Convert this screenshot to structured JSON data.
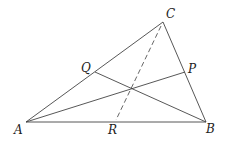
{
  "diagram": {
    "type": "triangle-cevians",
    "points": {
      "A": {
        "label": "A",
        "x": 26,
        "y": 122
      },
      "B": {
        "label": "B",
        "x": 206,
        "y": 122
      },
      "C": {
        "label": "C",
        "x": 163,
        "y": 22
      },
      "P": {
        "label": "P",
        "x": 185,
        "y": 72
      },
      "Q": {
        "label": "Q",
        "x": 95,
        "y": 72
      },
      "R": {
        "label": "R",
        "x": 116,
        "y": 120
      }
    },
    "labels": {
      "A": "A",
      "B": "B",
      "C": "C",
      "P": "P",
      "Q": "Q",
      "R": "R"
    },
    "segments": [
      {
        "from": "A",
        "to": "B",
        "style": "solid"
      },
      {
        "from": "B",
        "to": "C",
        "style": "solid"
      },
      {
        "from": "C",
        "to": "A",
        "style": "solid"
      },
      {
        "from": "A",
        "to": "P",
        "style": "solid"
      },
      {
        "from": "B",
        "to": "Q",
        "style": "solid"
      },
      {
        "from": "C",
        "to": "R",
        "style": "dashed"
      }
    ]
  }
}
